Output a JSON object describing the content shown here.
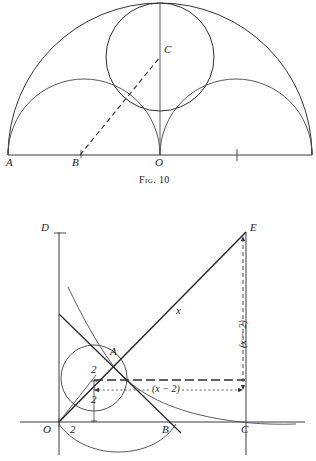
{
  "page": {
    "width": 316,
    "height": 461,
    "background": "#ffffff",
    "ink": "#1d1d1d"
  },
  "figures": [
    {
      "id": "fig-10",
      "caption": "Fig. 10",
      "caption_pos": {
        "x": 139,
        "y": 175
      },
      "description": "Arbelos construction: large semicircle on AO extended, two smaller semicircles, inscribed circle with center C, dashed line from B to C",
      "baseline": {
        "x1": 8,
        "y1": 155,
        "x2": 312,
        "y2": 155
      },
      "points": [
        {
          "name": "A",
          "label": "A",
          "x": 8,
          "y": 155,
          "label_x": 7,
          "label_y": 158
        },
        {
          "name": "B",
          "label": "B",
          "x": 80,
          "y": 155,
          "label_x": 73,
          "label_y": 158
        },
        {
          "name": "O",
          "label": "O",
          "x": 160,
          "y": 155,
          "label_x": 155,
          "label_y": 158
        },
        {
          "name": "C",
          "label": "C",
          "x": 160,
          "y": 55,
          "label_x": 164,
          "label_y": 45
        }
      ],
      "tick": {
        "x": 237,
        "y": 155
      },
      "arcs": [
        {
          "name": "outer-semicircle",
          "cx": 160,
          "cy": 155,
          "r": 152
        },
        {
          "name": "left-semicircle",
          "cx": 84,
          "cy": 155,
          "r": 76
        },
        {
          "name": "right-semicircle",
          "cx": 236,
          "cy": 155,
          "r": 76
        }
      ],
      "circle": {
        "name": "inscribed-circle",
        "cx": 160,
        "cy": 57,
        "r": 54
      },
      "dashed_line": {
        "x1": 80,
        "y1": 155,
        "x2": 160,
        "y2": 57
      },
      "vertical_line": {
        "x1": 160,
        "y1": 4,
        "x2": 160,
        "y2": 155
      }
    },
    {
      "id": "fig-lower",
      "description": "Coordinate diagram with line through A, tangent circle of radius 2, hyperbola branches, right triangle to E",
      "axes": {
        "x_axis": {
          "x1": 20,
          "y1": 422,
          "x2": 305,
          "y2": 422
        },
        "y_axis": {
          "x1": 59,
          "y1": 232,
          "x2": 59,
          "y2": 455
        },
        "origin": {
          "x": 59,
          "y": 422
        }
      },
      "points": [
        {
          "name": "D",
          "label": "D",
          "x": 59,
          "y": 232,
          "label_x": 43,
          "label_y": 224
        },
        {
          "name": "O",
          "label": "O",
          "x": 59,
          "y": 422,
          "label_x": 44,
          "label_y": 425
        },
        {
          "name": "A",
          "label": "A",
          "x": 108,
          "y": 358,
          "label_x": 110,
          "label_y": 348
        },
        {
          "name": "B",
          "label": "B",
          "x": 166,
          "y": 421,
          "label_x": 163,
          "label_y": 424
        },
        {
          "name": "C",
          "label": "C",
          "x": 246,
          "y": 422,
          "label_x": 242,
          "label_y": 425
        },
        {
          "name": "E",
          "label": "E",
          "x": 246,
          "y": 232,
          "label_x": 250,
          "label_y": 224
        }
      ],
      "labels": [
        {
          "name": "hypotenuse-label",
          "text": "x",
          "x": 176,
          "y": 307,
          "rot": 0
        },
        {
          "name": "radius-label-slant",
          "text": "2",
          "x": 93,
          "y": 367,
          "rot": 0
        },
        {
          "name": "radius-label-vertical",
          "text": "2",
          "x": 92,
          "y": 398,
          "rot": 0
        },
        {
          "name": "x-intercept-label",
          "text": "2",
          "x": 73,
          "y": 425,
          "rot": 0
        },
        {
          "name": "horizontal-run-label",
          "text": "(x − 2)",
          "x": 152,
          "y": 389,
          "rot": 0
        },
        {
          "name": "vertical-rise-label",
          "text": "(x − 2)",
          "x": 243,
          "y": 330,
          "rot": -90
        }
      ],
      "lines": [
        {
          "name": "hypotenuse-OE",
          "x1": 59,
          "y1": 422,
          "x2": 246,
          "y2": 232
        },
        {
          "name": "secant-line-DB",
          "x1": 59,
          "y1": 314,
          "x2": 180,
          "y2": 432
        },
        {
          "name": "vertical-CE",
          "x1": 246,
          "y1": 232,
          "x2": 246,
          "y2": 455
        },
        {
          "name": "radius-to-center",
          "x1": 59,
          "y1": 422,
          "x2": 108,
          "y2": 358
        },
        {
          "name": "center-vertical",
          "x1": 94,
          "y1": 378,
          "x2": 94,
          "y2": 422
        }
      ],
      "circle": {
        "name": "inscribed-circle",
        "cx": 94,
        "cy": 378,
        "r": 33
      },
      "dashed": [
        {
          "name": "dashed-horizontal-long",
          "x1": 94,
          "y1": 380,
          "x2": 246,
          "y2": 380
        },
        {
          "name": "dotted-horizontal",
          "x1": 94,
          "y1": 390,
          "x2": 246,
          "y2": 390
        },
        {
          "name": "dashed-vertical",
          "x1": 243,
          "y1": 236,
          "x2": 243,
          "y2": 388
        }
      ],
      "curves": [
        {
          "name": "hyperbola-upper-branch"
        },
        {
          "name": "hyperbola-lower-branch"
        }
      ]
    }
  ]
}
